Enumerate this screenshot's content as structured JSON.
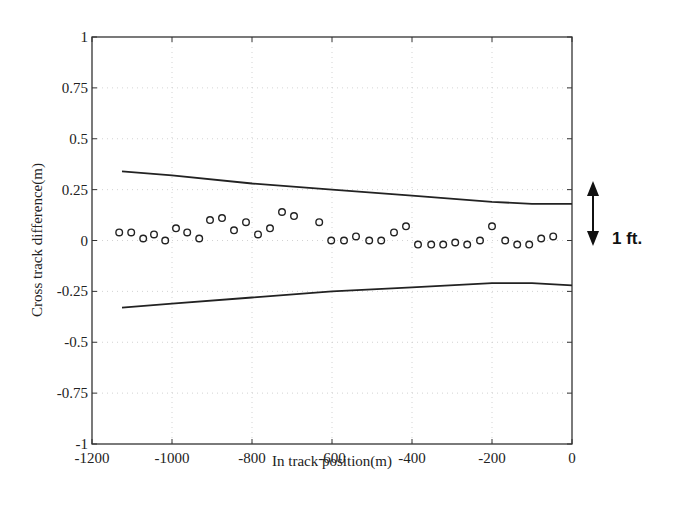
{
  "chart_data": {
    "type": "scatter",
    "title": "",
    "xlabel": "In track position(m)",
    "ylabel": "Cross track difference(m)",
    "xlim": [
      -1200,
      0
    ],
    "ylim": [
      -1,
      1
    ],
    "xticks": [
      -1200,
      -1000,
      -800,
      -600,
      -400,
      -200,
      0
    ],
    "xtick_labels": [
      "-1200",
      "-1000",
      "-800",
      "-600",
      "-400",
      "-200",
      "0"
    ],
    "yticks": [
      1,
      0.75,
      0.5,
      0.25,
      0,
      -0.25,
      -0.5,
      -0.75,
      -1
    ],
    "ytick_labels": [
      "1",
      "0.75",
      "0.5",
      "0.25",
      "0",
      "-0.25",
      "-0.5",
      "-0.75",
      "-1"
    ],
    "grid": true,
    "legend": null,
    "series": [
      {
        "name": "measured cross track difference",
        "type": "scatter",
        "marker": "open-circle",
        "x": [
          -1132,
          -1102,
          -1072,
          -1045,
          -1017,
          -990,
          -962,
          -932,
          -905,
          -875,
          -845,
          -815,
          -785,
          -755,
          -725,
          -695,
          -632,
          -602,
          -570,
          -540,
          -507,
          -477,
          -445,
          -415,
          -385,
          -352,
          -322,
          -292,
          -262,
          -230,
          -200,
          -167,
          -137,
          -107,
          -77,
          -47
        ],
        "y": [
          0.04,
          0.04,
          0.01,
          0.03,
          0.0,
          0.06,
          0.04,
          0.01,
          0.1,
          0.11,
          0.05,
          0.09,
          0.03,
          0.06,
          0.14,
          0.12,
          0.09,
          0.0,
          0.0,
          0.02,
          0.0,
          0.0,
          0.04,
          0.07,
          -0.02,
          -0.02,
          -0.02,
          -0.01,
          -0.02,
          0.0,
          0.07,
          0.0,
          -0.02,
          -0.02,
          0.01,
          0.02
        ]
      },
      {
        "name": "upper bound",
        "type": "line",
        "x": [
          -1125,
          -1000,
          -800,
          -600,
          -400,
          -200,
          -100,
          0
        ],
        "y": [
          0.34,
          0.32,
          0.28,
          0.25,
          0.22,
          0.19,
          0.18,
          0.18
        ]
      },
      {
        "name": "lower bound",
        "type": "line",
        "x": [
          -1125,
          -1000,
          -800,
          -600,
          -400,
          -200,
          -100,
          0
        ],
        "y": [
          -0.33,
          -0.31,
          -0.28,
          -0.25,
          -0.23,
          -0.21,
          -0.21,
          -0.22
        ]
      }
    ],
    "annotations": [
      {
        "text": "1 ft.",
        "type": "double-arrow",
        "y_from": 0.29,
        "y_to": -0.02
      }
    ]
  }
}
